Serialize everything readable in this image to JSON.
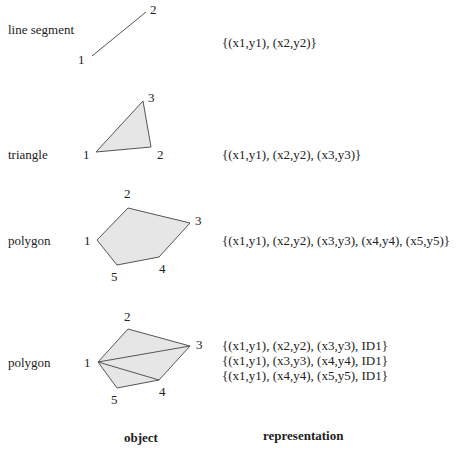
{
  "diagram": {
    "rows": [
      {
        "object_label": "line segment",
        "vertices": [
          "1",
          "2"
        ],
        "representation": [
          "{(x1,y1), (x2,y2)}"
        ]
      },
      {
        "object_label": "triangle",
        "vertices": [
          "1",
          "2",
          "3"
        ],
        "representation": [
          "{(x1,y1), (x2,y2), (x3,y3)}"
        ]
      },
      {
        "object_label": "polygon",
        "vertices": [
          "1",
          "2",
          "3",
          "4",
          "5"
        ],
        "representation": [
          "{(x1,y1), (x2,y2), (x3,y3), (x4,y4), (x5,y5)}"
        ]
      },
      {
        "object_label": "polygon",
        "vertices": [
          "1",
          "2",
          "3",
          "4",
          "5"
        ],
        "representation": [
          "{(x1,y1), (x2,y2), (x3,y3), ID1}",
          "{(x1,y1), (x3,y3), (x4,y4), ID1}",
          "{(x1,y1), (x4,y4), (x5,y5), ID1}"
        ]
      }
    ],
    "column_headers": {
      "object": "object",
      "representation": "representation"
    },
    "colors": {
      "fill": "#e6e6e6",
      "stroke": "#555555"
    }
  }
}
